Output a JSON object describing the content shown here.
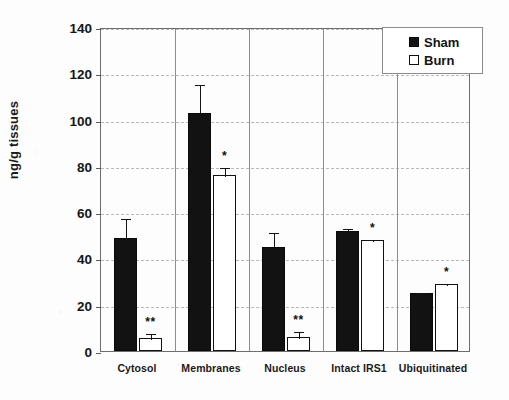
{
  "chart_data": {
    "type": "bar",
    "title": "",
    "subtitle": "",
    "xlabel": "",
    "ylabel": "ng/g tissues",
    "ylim": [
      0,
      140
    ],
    "yticks": [
      0,
      20,
      40,
      60,
      80,
      100,
      120,
      140
    ],
    "ytick_labels": [
      "0",
      "20",
      "40",
      "60",
      "80",
      "100",
      "120",
      "140"
    ],
    "grid": true,
    "legend_position": "top-right",
    "categories": [
      "Cytosol",
      "Membranes",
      "Nucleus",
      "Intact IRS1",
      "Ubiquitinated"
    ],
    "series": [
      {
        "name": "Sham",
        "color": "#121212",
        "fill": "solid",
        "values": [
          49,
          103,
          45,
          52,
          25
        ],
        "errors": [
          9,
          13,
          7,
          1.5,
          1
        ],
        "significance": [
          "",
          "",
          "",
          "",
          ""
        ]
      },
      {
        "name": "Burn",
        "color": "#ffffff",
        "fill": "hollow",
        "values": [
          5.5,
          76,
          6,
          48,
          29
        ],
        "errors": [
          2.5,
          4,
          3,
          0.8,
          0.8
        ],
        "significance": [
          "**",
          "*",
          "**",
          "*",
          "*"
        ]
      }
    ],
    "significance_note": "* and ** denote significant difference from Sham"
  },
  "legend": {
    "entries": [
      {
        "label": "Sham",
        "marker": "filled-square-icon"
      },
      {
        "label": "Burn",
        "marker": "hollow-square-icon"
      }
    ]
  }
}
